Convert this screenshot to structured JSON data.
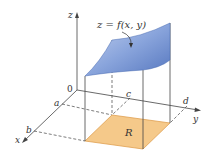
{
  "figure": {
    "surface_label": "z = f(x, y)",
    "region_label": "R",
    "axes": {
      "x": "x",
      "y": "y",
      "z": "z",
      "origin": "0"
    },
    "bounds": {
      "a": "a",
      "b": "b",
      "c": "c",
      "d": "d"
    },
    "colors": {
      "surface_light": "#a9bde6",
      "surface_dark": "#5b7fc4",
      "region_fill": "#f5c98a",
      "region_edge": "#e0a050",
      "line": "#444444"
    }
  }
}
